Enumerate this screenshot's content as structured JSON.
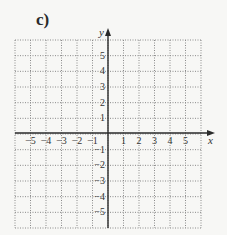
{
  "problem_label": "c)",
  "grid": {
    "x_range": [
      -6,
      6
    ],
    "y_range": [
      -6,
      6
    ],
    "x_axis_label": "x",
    "y_axis_label": "y",
    "x_ticks": [
      "-5",
      "-4",
      "-3",
      "-2",
      "-1",
      "1",
      "2",
      "3",
      "4",
      "5"
    ],
    "y_ticks": [
      "5",
      "4",
      "3",
      "2",
      "1",
      "-1",
      "-2",
      "-3",
      "-4",
      "-5"
    ],
    "gridline_style": "dotted",
    "colors": {
      "grid": "#8a8a8a",
      "axis": "#2a2a2a",
      "background": "#f7f7f5"
    }
  }
}
